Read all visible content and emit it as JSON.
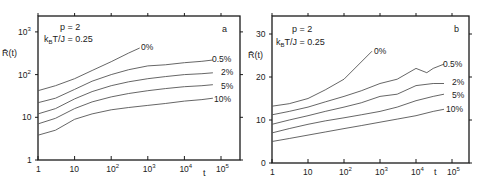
{
  "chart_data": [
    {
      "panel": "a",
      "type": "line",
      "title": "",
      "annotations": [
        "p = 2",
        "k_B T/J = 0.25"
      ],
      "panel_label": "a",
      "xlabel": "t",
      "ylabel": "R̄(t)",
      "xscale": "log",
      "yscale": "log",
      "xlim": [
        1,
        200000
      ],
      "ylim": [
        1,
        3000
      ],
      "xticks": [
        "1",
        "10",
        "10²",
        "10³",
        "10⁴",
        "10⁵"
      ],
      "yticks": [
        "1",
        "10",
        "10²",
        "10³"
      ],
      "grid": false,
      "series": [
        {
          "name": "0%",
          "x": [
            1,
            3,
            10,
            30,
            100,
            300,
            600
          ],
          "y": [
            42,
            55,
            80,
            125,
            200,
            320,
            420
          ]
        },
        {
          "name": "0.5%",
          "x": [
            1,
            3,
            10,
            30,
            100,
            300,
            1000,
            3000,
            10000,
            30000,
            60000
          ],
          "y": [
            22,
            28,
            45,
            70,
            100,
            130,
            160,
            170,
            190,
            205,
            220
          ]
        },
        {
          "name": "2%",
          "x": [
            1,
            3,
            10,
            30,
            100,
            300,
            1000,
            3000,
            10000,
            30000,
            60000
          ],
          "y": [
            12,
            16,
            27,
            40,
            55,
            68,
            80,
            90,
            100,
            105,
            110
          ]
        },
        {
          "name": "5%",
          "x": [
            1,
            3,
            10,
            30,
            100,
            300,
            1000,
            3000,
            10000,
            30000,
            60000
          ],
          "y": [
            7,
            9.5,
            16,
            23,
            30,
            36,
            42,
            47,
            52,
            55,
            58
          ]
        },
        {
          "name": "10%",
          "x": [
            1,
            3,
            10,
            30,
            100,
            300,
            1000,
            3000,
            10000,
            30000,
            60000
          ],
          "y": [
            3.8,
            5,
            9,
            12,
            15,
            17,
            19,
            21,
            24,
            26,
            28
          ]
        }
      ]
    },
    {
      "panel": "b",
      "type": "line",
      "title": "",
      "annotations": [
        "p = 2",
        "k_B T/J = 0.25"
      ],
      "panel_label": "b",
      "xlabel": "t",
      "ylabel": "R̄(t)",
      "xscale": "log",
      "yscale": "linear",
      "xlim": [
        1,
        200000
      ],
      "ylim": [
        0,
        35
      ],
      "xticks": [
        "1",
        "10",
        "10²",
        "10³",
        "10⁴",
        "10⁵"
      ],
      "yticks": [
        "0",
        "10",
        "20",
        "30"
      ],
      "grid": false,
      "series": [
        {
          "name": "0%",
          "x": [
            1,
            3,
            10,
            30,
            100,
            300,
            600
          ],
          "y": [
            13.2,
            13.8,
            15,
            17,
            19.5,
            23.5,
            26
          ]
        },
        {
          "name": "0.5%",
          "x": [
            1,
            3,
            10,
            30,
            100,
            300,
            1000,
            3000,
            10000,
            20000,
            30000,
            60000
          ],
          "y": [
            11.2,
            12,
            13,
            14.2,
            15.5,
            16.8,
            18.5,
            19.5,
            22,
            21,
            22,
            23
          ]
        },
        {
          "name": "2%",
          "x": [
            1,
            3,
            10,
            30,
            100,
            300,
            1000,
            3000,
            10000,
            30000,
            60000
          ],
          "y": [
            9,
            10,
            11,
            12,
            13,
            14,
            15.5,
            16,
            18,
            18.5,
            18.5
          ]
        },
        {
          "name": "5%",
          "x": [
            1,
            3,
            10,
            30,
            100,
            300,
            1000,
            3000,
            10000,
            30000,
            60000
          ],
          "y": [
            7,
            8,
            9,
            9.8,
            10.5,
            11.2,
            12,
            13,
            14.5,
            15.5,
            16
          ]
        },
        {
          "name": "10%",
          "x": [
            1,
            3,
            10,
            30,
            100,
            300,
            1000,
            3000,
            10000,
            30000,
            60000
          ],
          "y": [
            5,
            5.7,
            6.5,
            7.2,
            8,
            8.7,
            9.5,
            10.2,
            11,
            12,
            12.5
          ]
        }
      ]
    }
  ],
  "panels": {
    "a": {
      "param_p": "p = 2",
      "param_T": "k",
      "param_T_sub": "B",
      "param_T_rest": "T/J = 0.25",
      "label": "a",
      "ylabel": "R̄(t)",
      "xlabel": "t",
      "yticks": [
        "1",
        "10",
        "10",
        "10"
      ],
      "ytick_sups": [
        "",
        "",
        "2",
        "3"
      ],
      "xticks": [
        "1",
        "10",
        "10",
        "10",
        "10",
        "10"
      ],
      "xtick_sups": [
        "",
        "",
        "2",
        "3",
        "4",
        "5"
      ],
      "curve_labels": [
        "0%",
        "0.5%",
        "2%",
        "5%",
        "10%"
      ]
    },
    "b": {
      "param_p": "p = 2",
      "param_T": "k",
      "param_T_sub": "B",
      "param_T_rest": "T/J = 0.25",
      "label": "b",
      "ylabel": "R̄(t)",
      "xlabel": "t",
      "yticks": [
        "0",
        "10",
        "20",
        "30"
      ],
      "xticks": [
        "1",
        "10",
        "10",
        "10",
        "10",
        "10"
      ],
      "xtick_sups": [
        "",
        "",
        "2",
        "3",
        "4",
        "5"
      ],
      "curve_labels": [
        "0%",
        "0.5%",
        "2%",
        "5%",
        "10%"
      ]
    }
  },
  "colors": {
    "line": "#555555",
    "frame": "#1a1a1a",
    "text": "#222222"
  }
}
